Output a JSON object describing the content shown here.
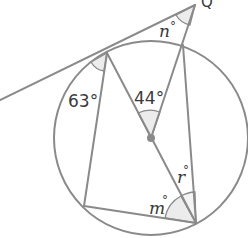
{
  "diagram": {
    "type": "circle-geometry",
    "points": {
      "Q": {
        "label": "Q",
        "x": 195,
        "y": 5
      },
      "T": {
        "x": 107,
        "y": 53
      },
      "P": {
        "x": 183,
        "y": 45
      },
      "O": {
        "x": 151,
        "y": 138
      },
      "B": {
        "x": 196,
        "y": 223
      },
      "C": {
        "x": 84,
        "y": 206
      },
      "L": {
        "x": 0,
        "y": 100
      }
    },
    "circle": {
      "cx": 151,
      "cy": 138,
      "r": 97
    },
    "angles": {
      "tangent_chord": {
        "label": "63°",
        "value": 63
      },
      "centre": {
        "label": "44°",
        "value": 44
      },
      "at_Q": {
        "label": "n°",
        "variable": "n"
      },
      "m": {
        "label": "m°",
        "variable": "m"
      },
      "r": {
        "label": "r°",
        "variable": "r"
      }
    },
    "colors": {
      "line": "#8a8a8a",
      "shade": "#ececec",
      "text": "#3a3a3a",
      "centre_dot": "#8a8a8a"
    }
  },
  "labels": {
    "Q": "Q",
    "a63": "63°",
    "a44": "44°",
    "n_var": "n",
    "m_var": "m",
    "r_var": "r",
    "deg": "°"
  }
}
